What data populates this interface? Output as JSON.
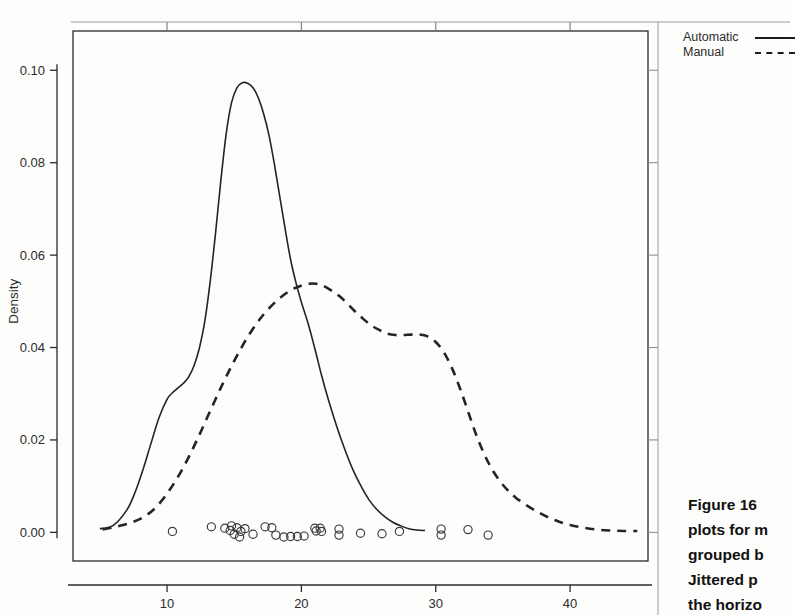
{
  "figure": {
    "caption_lines": [
      "Figure 16",
      "plots for m",
      "grouped b",
      "Jittered p",
      "the horizo"
    ]
  },
  "legend": {
    "position": "top-right",
    "entries": [
      {
        "label": "Automatic",
        "style": "solid",
        "key_name": "solid-line-key"
      },
      {
        "label": "Manual",
        "style": "dashed",
        "key_name": "dashed-line-key"
      }
    ]
  },
  "chart_data": {
    "type": "line",
    "title": "",
    "subtitle": "",
    "xlabel": "Miles per Gallon",
    "ylabel": "Density",
    "xlim": [
      3.0,
      45.8
    ],
    "ylim": [
      -0.0062,
      0.1085
    ],
    "xticks": [
      10,
      20,
      30,
      40
    ],
    "xtick_labels": [
      "10",
      "20",
      "30",
      "40"
    ],
    "yticks": [
      0.0,
      0.02,
      0.04,
      0.06,
      0.08,
      0.1
    ],
    "ytick_labels": [
      "0.00",
      "0.02",
      "0.04",
      "0.06",
      "0.08",
      "0.10"
    ],
    "grid": false,
    "legend_position": "outside-top-right",
    "series": [
      {
        "name": "Automatic",
        "style": "solid",
        "peak_x": 16.2,
        "peak_y": 0.0973,
        "x": [
          5.0,
          6.0,
          7.0,
          7.6,
          8.2,
          8.8,
          9.4,
          10.0,
          10.4,
          10.8,
          11.2,
          11.6,
          12.0,
          12.4,
          12.8,
          13.2,
          13.6,
          14.0,
          14.4,
          14.8,
          15.2,
          15.6,
          16.0,
          16.4,
          16.8,
          17.2,
          17.6,
          18.0,
          18.4,
          18.8,
          19.2,
          19.6,
          20.0,
          20.5,
          21.0,
          21.5,
          22.0,
          22.6,
          23.2,
          23.8,
          24.4,
          25.0,
          25.6,
          26.2,
          26.8,
          27.4,
          28.0,
          28.6,
          29.2
        ],
        "y": [
          0.0008,
          0.0015,
          0.0048,
          0.0085,
          0.0135,
          0.0192,
          0.0248,
          0.0288,
          0.0302,
          0.0312,
          0.0322,
          0.0336,
          0.036,
          0.0398,
          0.0455,
          0.054,
          0.0645,
          0.076,
          0.0862,
          0.093,
          0.0962,
          0.0973,
          0.0972,
          0.0962,
          0.094,
          0.0905,
          0.0858,
          0.0795,
          0.0725,
          0.0655,
          0.059,
          0.054,
          0.0498,
          0.0452,
          0.0398,
          0.034,
          0.0288,
          0.0232,
          0.0182,
          0.0138,
          0.0102,
          0.0072,
          0.005,
          0.0034,
          0.0022,
          0.0014,
          0.0008,
          0.0005,
          0.0004
        ]
      },
      {
        "name": "Manual",
        "style": "dashed",
        "peak_x": 21.1,
        "peak_y": 0.0538,
        "shoulder_x": 28.0,
        "shoulder_y": 0.0428,
        "x": [
          5.2,
          6.2,
          7.2,
          8.2,
          9.2,
          10.2,
          11.2,
          12.2,
          13.2,
          14.2,
          15.2,
          16.2,
          17.2,
          18.2,
          19.2,
          20.0,
          20.6,
          21.1,
          21.6,
          22.2,
          22.8,
          23.4,
          24.0,
          24.6,
          25.2,
          25.8,
          26.4,
          27.0,
          27.6,
          28.2,
          28.8,
          29.4,
          30.0,
          30.6,
          31.2,
          31.8,
          32.4,
          33.0,
          33.6,
          34.2,
          34.8,
          35.4,
          36.0,
          36.8,
          37.6,
          38.4,
          39.2,
          40.0,
          41.0,
          42.0,
          43.0,
          44.0,
          45.0
        ],
        "y": [
          0.0006,
          0.0012,
          0.002,
          0.0032,
          0.0055,
          0.0092,
          0.014,
          0.0198,
          0.0262,
          0.0325,
          0.0382,
          0.0432,
          0.0472,
          0.0502,
          0.0524,
          0.0534,
          0.0538,
          0.0538,
          0.0534,
          0.0524,
          0.0512,
          0.0496,
          0.0478,
          0.0462,
          0.0448,
          0.0438,
          0.043,
          0.0427,
          0.0427,
          0.0428,
          0.0428,
          0.0424,
          0.0412,
          0.039,
          0.0356,
          0.0312,
          0.0262,
          0.0212,
          0.017,
          0.0136,
          0.011,
          0.009,
          0.0074,
          0.0058,
          0.0044,
          0.0032,
          0.0023,
          0.0016,
          0.001,
          0.0006,
          0.0004,
          0.0003,
          0.0003
        ]
      }
    ],
    "rug": {
      "name": "Jittered points",
      "marker": "open-circle",
      "y_base": 0.0005,
      "points": [
        [
          10.4,
          0.0002
        ],
        [
          13.3,
          0.0012
        ],
        [
          14.3,
          0.0009
        ],
        [
          14.7,
          0.0004
        ],
        [
          14.8,
          0.0014
        ],
        [
          15.0,
          -0.0004
        ],
        [
          15.2,
          0.001
        ],
        [
          15.4,
          -0.001
        ],
        [
          15.5,
          0.0002
        ],
        [
          15.8,
          0.0008
        ],
        [
          16.4,
          -0.0004
        ],
        [
          17.3,
          0.0012
        ],
        [
          17.8,
          0.001
        ],
        [
          18.1,
          -0.0006
        ],
        [
          18.7,
          -0.001
        ],
        [
          19.2,
          -0.0009
        ],
        [
          19.7,
          -0.0009
        ],
        [
          20.2,
          -0.0008
        ],
        [
          21.0,
          0.0009
        ],
        [
          21.1,
          0.0003
        ],
        [
          21.4,
          0.0009
        ],
        [
          21.5,
          0.0002
        ],
        [
          22.8,
          0.0007
        ],
        [
          22.8,
          -0.0006
        ],
        [
          24.4,
          -0.0002
        ],
        [
          26.0,
          -0.0003
        ],
        [
          27.3,
          0.0002
        ],
        [
          30.4,
          0.0007
        ],
        [
          30.4,
          -0.0006
        ],
        [
          32.4,
          0.0006
        ],
        [
          33.9,
          -0.0006
        ]
      ]
    }
  }
}
